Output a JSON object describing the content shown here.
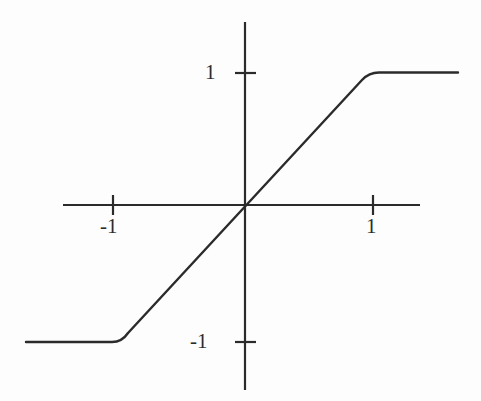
{
  "figure": {
    "title": "",
    "background_color": "#fdfdfd",
    "stroke_color": "#2b2b2b",
    "width": 481,
    "height": 401
  },
  "axes": {
    "x_axis": {
      "name": "x-axis",
      "pixel_y": 205,
      "pixel_x_start": 63,
      "pixel_x_end": 420
    },
    "y_axis": {
      "name": "y-axis",
      "pixel_x": 245,
      "pixel_y_start": 22,
      "pixel_y_end": 390
    },
    "origin": {
      "x": 245,
      "y": 205
    },
    "unit_px_x": 128,
    "unit_px_y": 133
  },
  "ticks": {
    "x": [
      {
        "value": -1,
        "label": "-1",
        "pixel_x": 113
      },
      {
        "value": 1,
        "label": "1",
        "pixel_x": 373
      }
    ],
    "y": [
      {
        "value": 1,
        "label": "1",
        "pixel_y": 73
      },
      {
        "value": -1,
        "label": "-1",
        "pixel_y": 342
      }
    ],
    "tick_half_length": 10
  },
  "chart_data": {
    "type": "line",
    "title": "",
    "subtitle": "",
    "xlabel": "",
    "ylabel": "",
    "xlim": [
      -1.42,
      1.37
    ],
    "ylim": [
      -1.38,
      1.38
    ],
    "grid": false,
    "legend": null,
    "annotations": [],
    "xticks": [
      -1,
      1
    ],
    "xticklabels": [
      "-1",
      "1"
    ],
    "yticks": [
      -1,
      1
    ],
    "yticklabels": [
      "-1",
      "1"
    ],
    "series": [
      {
        "name": "saturating-linear",
        "x": [
          -1.42,
          -1.1,
          -1.0,
          -0.9,
          -0.5,
          0.0,
          0.5,
          0.9,
          1.0,
          1.1,
          1.37
        ],
        "y": [
          -1.0,
          -1.0,
          -0.99,
          -0.9,
          -0.5,
          0.0,
          0.5,
          0.9,
          0.99,
          1.0,
          1.0
        ]
      }
    ],
    "key_points": [
      {
        "label": "left-saturation-start",
        "x": -1.42,
        "y": -1.0
      },
      {
        "label": "left-knee",
        "x": -1.0,
        "y": -1.0
      },
      {
        "label": "origin",
        "x": 0,
        "y": 0
      },
      {
        "label": "right-knee",
        "x": 1.0,
        "y": 1.0
      },
      {
        "label": "right-saturation-end",
        "x": 1.37,
        "y": 1.0
      }
    ]
  },
  "curve_path": {
    "name": "saturating-linear-curve",
    "d": "M 26 342 L 112 342 Q 122 342 128 333 L 362 80 Q 369 72.5 379 72.5 L 458 72.5"
  }
}
